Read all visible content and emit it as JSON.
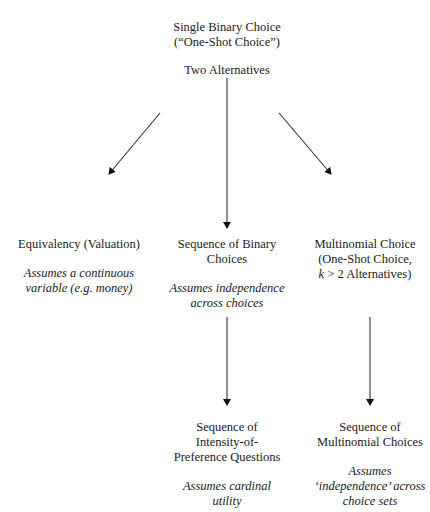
{
  "header": {
    "faint_running_title": ""
  },
  "nodes": {
    "root": {
      "title_line1": "Single Binary Choice",
      "title_line2": "(“One-Shot Choice”)",
      "subtitle": "Two Alternatives"
    },
    "equivalency": {
      "title": "Equivalency (Valuation)",
      "assumption_line1": "Assumes a continuous",
      "assumption_line2": "variable (e.g. money)"
    },
    "sequence_binary": {
      "title_line1": "Sequence of Binary",
      "title_line2": "Choices",
      "assumption_line1": "Assumes independence",
      "assumption_line2": "across choices"
    },
    "multinomial": {
      "title_line1": "Multinomial Choice",
      "title_line2": "(One-Shot Choice,",
      "title_line3_var": "k",
      "title_line3_rest": " > 2 Alternatives)"
    },
    "intensity": {
      "title_line1": "Sequence of",
      "title_line2": "Intensity-of-",
      "title_line3": "Preference Questions",
      "assumption_line1": "Assumes cardinal",
      "assumption_line2": "utility"
    },
    "sequence_multinomial": {
      "title_line1": "Sequence of",
      "title_line2": "Multinomial Choices",
      "assumption_line1": "Assumes",
      "assumption_line2": "‘independence’ across",
      "assumption_line3": "choice sets"
    }
  },
  "edges": [
    {
      "from": "root",
      "to": "equivalency"
    },
    {
      "from": "root",
      "to": "sequence_binary"
    },
    {
      "from": "root",
      "to": "multinomial"
    },
    {
      "from": "sequence_binary",
      "to": "intensity"
    },
    {
      "from": "multinomial",
      "to": "sequence_multinomial"
    }
  ]
}
